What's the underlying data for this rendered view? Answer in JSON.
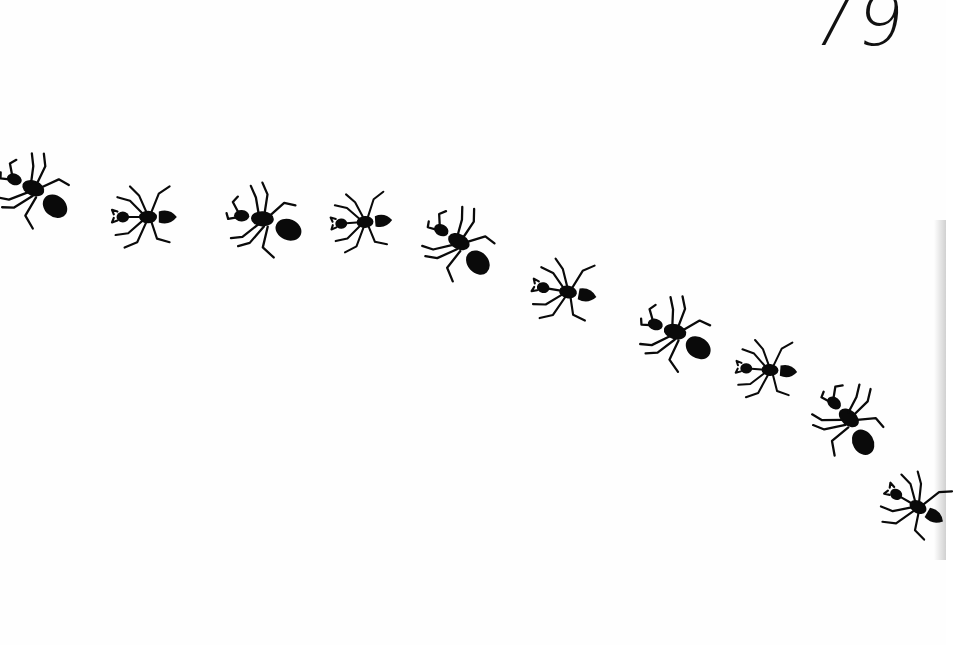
{
  "page": {
    "number": "79",
    "background": "#fefefe",
    "ink": "#0a0a0a"
  },
  "illustration": {
    "subject": "line of ants walking along a curved path",
    "ants": [
      {
        "x": 38,
        "y": 192,
        "rotate": 20,
        "scale": 0.95,
        "variant": "big"
      },
      {
        "x": 148,
        "y": 217,
        "rotate": 0,
        "scale": 0.9,
        "variant": "small"
      },
      {
        "x": 268,
        "y": 221,
        "rotate": 3,
        "scale": 0.95,
        "variant": "big"
      },
      {
        "x": 365,
        "y": 222,
        "rotate": -4,
        "scale": 0.85,
        "variant": "small"
      },
      {
        "x": 463,
        "y": 246,
        "rotate": 28,
        "scale": 0.95,
        "variant": "big"
      },
      {
        "x": 568,
        "y": 292,
        "rotate": 10,
        "scale": 0.9,
        "variant": "small"
      },
      {
        "x": 680,
        "y": 335,
        "rotate": 15,
        "scale": 0.95,
        "variant": "big"
      },
      {
        "x": 770,
        "y": 370,
        "rotate": 4,
        "scale": 0.85,
        "variant": "small"
      },
      {
        "x": 852,
        "y": 423,
        "rotate": 40,
        "scale": 0.95,
        "variant": "big"
      },
      {
        "x": 918,
        "y": 507,
        "rotate": 30,
        "scale": 0.9,
        "variant": "small"
      }
    ]
  }
}
